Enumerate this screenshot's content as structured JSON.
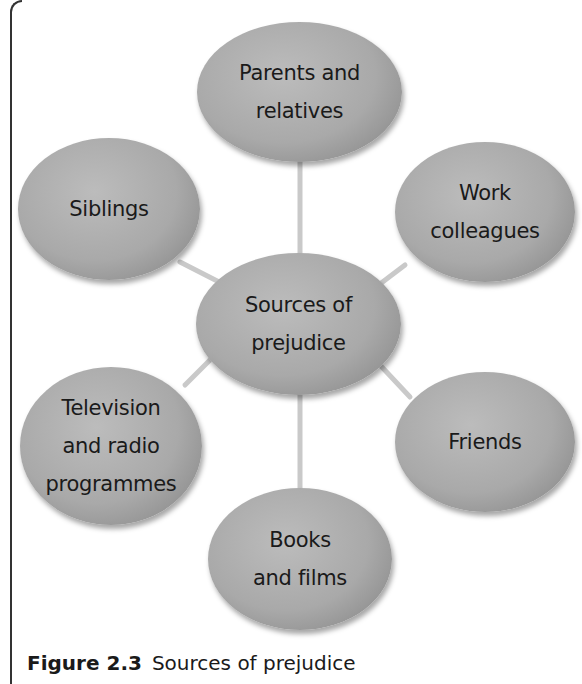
{
  "diagram": {
    "center": {
      "label": "Sources of\nprejudice"
    },
    "nodes": [
      {
        "id": "parents",
        "label": "Parents and\nrelatives"
      },
      {
        "id": "siblings",
        "label": "Siblings"
      },
      {
        "id": "work",
        "label": "Work\ncolleagues"
      },
      {
        "id": "tv",
        "label": "Television\nand radio\nprogrammes"
      },
      {
        "id": "friends",
        "label": "Friends"
      },
      {
        "id": "books",
        "label": "Books\nand films"
      }
    ]
  },
  "caption": {
    "number": "Figure 2.3",
    "text": "Sources of prejudice"
  },
  "colors": {
    "node_fill": "#a9a9a9",
    "link": "#c8c8c8",
    "text": "#1a1a1a"
  }
}
